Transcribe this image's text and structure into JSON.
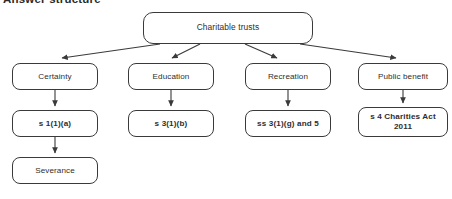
{
  "heading": "Answer structure",
  "diagram": {
    "type": "flowchart",
    "root": {
      "id": "charitable-trusts",
      "label": "Charitable trusts",
      "x": 143,
      "y": 12,
      "w": 170,
      "h": 32
    },
    "columns": [
      {
        "id": "certainty",
        "nodes": [
          {
            "id": "certainty",
            "label": "Certainty",
            "x": 12,
            "y": 63,
            "w": 86,
            "h": 27
          },
          {
            "id": "s1-1-a",
            "label": "s 1(1)(a)",
            "bold": true,
            "x": 12,
            "y": 110,
            "w": 86,
            "h": 27
          },
          {
            "id": "severance",
            "label": "Severance",
            "x": 12,
            "y": 157,
            "w": 86,
            "h": 27
          }
        ]
      },
      {
        "id": "education",
        "nodes": [
          {
            "id": "education",
            "label": "Education",
            "x": 128,
            "y": 63,
            "w": 86,
            "h": 27
          },
          {
            "id": "s3-1-b",
            "label": "s 3(1)(b)",
            "bold": true,
            "x": 128,
            "y": 110,
            "w": 86,
            "h": 27
          }
        ]
      },
      {
        "id": "recreation",
        "nodes": [
          {
            "id": "recreation",
            "label": "Recreation",
            "x": 245,
            "y": 63,
            "w": 86,
            "h": 27
          },
          {
            "id": "ss3-1-g-and-5",
            "label": "ss 3(1)(g) and 5",
            "bold": true,
            "x": 245,
            "y": 110,
            "w": 86,
            "h": 27
          }
        ]
      },
      {
        "id": "public-benefit",
        "nodes": [
          {
            "id": "public-benefit",
            "label": "Public benefit",
            "x": 358,
            "y": 63,
            "w": 90,
            "h": 27
          },
          {
            "id": "s4-charities-act-2011",
            "label": "s 4 Charities Act",
            "label_line2": "2011",
            "bold": true,
            "x": 358,
            "y": 107,
            "w": 90,
            "h": 30
          }
        ]
      }
    ],
    "edges": [
      {
        "from": "charitable-trusts",
        "to": "certainty",
        "kind": "diagonal"
      },
      {
        "from": "charitable-trusts",
        "to": "education",
        "kind": "diagonal"
      },
      {
        "from": "charitable-trusts",
        "to": "recreation",
        "kind": "diagonal"
      },
      {
        "from": "charitable-trusts",
        "to": "public-benefit",
        "kind": "diagonal"
      },
      {
        "from": "certainty",
        "to": "s1-1-a",
        "kind": "vertical"
      },
      {
        "from": "s1-1-a",
        "to": "severance",
        "kind": "vertical"
      },
      {
        "from": "education",
        "to": "s3-1-b",
        "kind": "vertical"
      },
      {
        "from": "recreation",
        "to": "ss3-1-g-and-5",
        "kind": "vertical"
      },
      {
        "from": "public-benefit",
        "to": "s4-charities-act-2011",
        "kind": "vertical"
      }
    ],
    "style": {
      "stroke": "#3a3a3a",
      "background": "#ffffff",
      "text": "#2e2e2e"
    }
  }
}
